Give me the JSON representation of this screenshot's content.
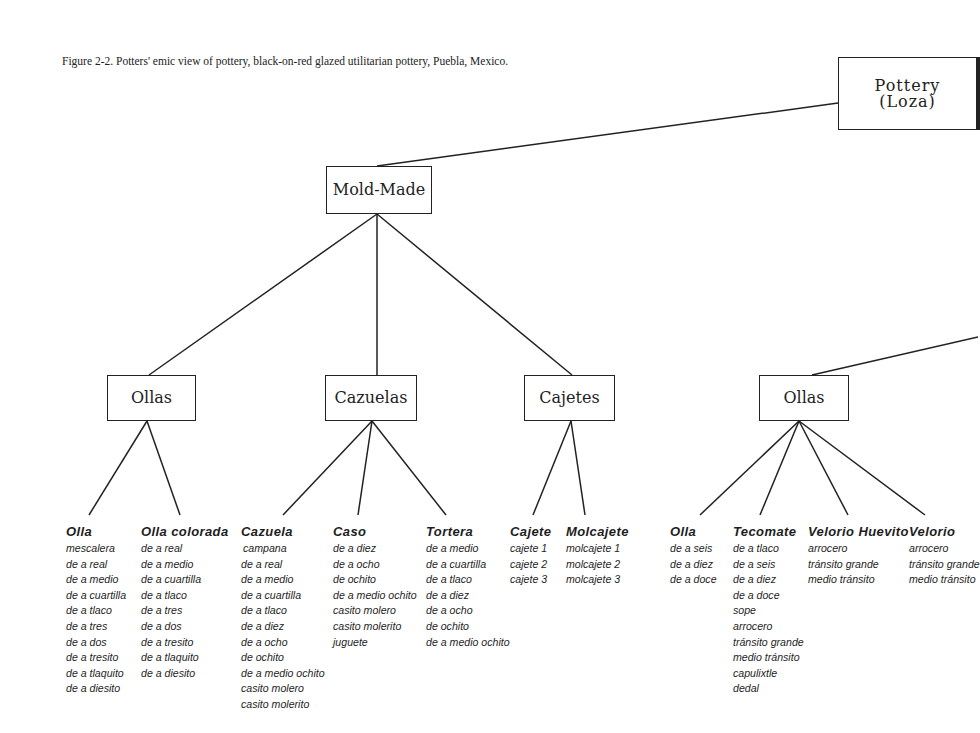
{
  "caption": "Figure 2-2. Potters' emic view of pottery, black-on-red glazed utilitarian pottery, Puebla, Mexico.",
  "nodes": {
    "root": {
      "line1": "Pottery",
      "line2": "(Loza)"
    },
    "mold_made": "Mold-Made",
    "ollas_left": "Ollas",
    "cazuelas": "Cazuelas",
    "cajetes": "Cajetes",
    "ollas_right": "Ollas"
  },
  "columns": [
    {
      "heading": "Olla",
      "items": [
        "mescalera",
        "de a real",
        "de a medio",
        "de a cuartilla",
        "de a tlaco",
        "de a tres",
        "de a dos",
        "de a tresito",
        "de a tlaquito",
        "de a diesito"
      ]
    },
    {
      "heading": "Olla colorada",
      "items": [
        "de a real",
        "de a medio",
        "de a cuartilla",
        "de a tlaco",
        "de a tres",
        "de a dos",
        "de a tresito",
        "de a tlaquito",
        "de a diesito"
      ]
    },
    {
      "heading": "Cazuela",
      "items": [
        "campana",
        "de a real",
        "de a medio",
        "de a cuartilla",
        "de a tlaco",
        "de a diez",
        "de a ocho",
        "de ochito",
        "de a medio ochito",
        "casito molero",
        "casito molerito"
      ]
    },
    {
      "heading": "Caso",
      "items": [
        "de a diez",
        "de a ocho",
        "de ochito",
        "de a medio ochito",
        "casito molero",
        "casito molerito",
        "juguete"
      ]
    },
    {
      "heading": "Tortera",
      "items": [
        "de a medio",
        "de a cuartilla",
        "de a tlaco",
        "de a diez",
        "de a ocho",
        "de ochito",
        "de a medio  ochito"
      ]
    },
    {
      "heading": "Cajete",
      "items": [
        "cajete 1",
        "cajete  2",
        "cajete 3"
      ]
    },
    {
      "heading": "Molcajete",
      "items": [
        "molcajete 1",
        "molcajete 2",
        "molcajete 3"
      ]
    },
    {
      "heading": "Olla",
      "items": [
        "de a seis",
        "de a diez",
        "de a doce"
      ]
    },
    {
      "heading": "Tecomate",
      "items": [
        "de a tlaco",
        "de a seis",
        "de a diez",
        "de a doce",
        "sope",
        "arrocero",
        "tránsito grande",
        "medio tránsito",
        "capulixtle",
        "dedal"
      ]
    },
    {
      "heading": "Velorio Huevito",
      "items": [
        "arrocero",
        "tránsito grande",
        "medio tránsito"
      ]
    },
    {
      "heading": "Velorio",
      "items": [
        "arrocero",
        "tránsito grande",
        "medio tránsito"
      ]
    }
  ]
}
